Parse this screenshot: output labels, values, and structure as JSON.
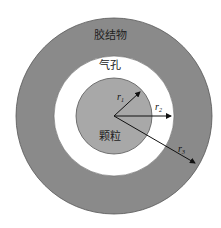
{
  "diagram": {
    "type": "concentric-circles",
    "center": [
      114,
      116
    ],
    "layers": [
      {
        "name": "cement",
        "label": "胶结物",
        "radius": 98,
        "fill": "#8a8a8a"
      },
      {
        "name": "pore",
        "label": "气孔",
        "radius": 60,
        "fill": "#ffffff"
      },
      {
        "name": "particle",
        "label": "颗粒",
        "radius": 38,
        "fill": "#a8a8a8"
      }
    ],
    "radii": [
      {
        "label": "r",
        "sub": "1",
        "to": [
          140,
          92
        ]
      },
      {
        "label": "r",
        "sub": "2",
        "to": [
          171,
          116
        ]
      },
      {
        "label": "r",
        "sub": "3",
        "to": [
          195,
          163
        ]
      }
    ]
  },
  "labels": {
    "cement": "胶结物",
    "pore": "气孔",
    "particle": "颗粒",
    "r1": "r",
    "r1_sub": "1",
    "r2": "r",
    "r2_sub": "2",
    "r3": "r",
    "r3_sub": "3"
  }
}
